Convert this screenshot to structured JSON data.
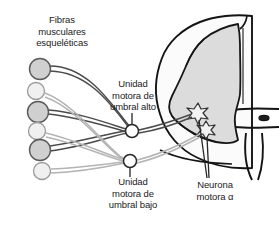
{
  "figure": {
    "background_color": "#ffffff"
  },
  "labels": {
    "muscle_fibers": {
      "name": "muscle-fibers-label",
      "lines": [
        "Fibras",
        "musculares",
        "esqueléticas"
      ]
    },
    "high_threshold_unit": {
      "name": "high-threshold-motor-unit-label",
      "lines": [
        "Unidad",
        "motora de",
        "umbral alto"
      ]
    },
    "low_threshold_unit": {
      "name": "low-threshold-motor-unit-label",
      "lines": [
        "Unidad",
        "motora de",
        "umbral bajo"
      ]
    },
    "alpha_motor_neuron": {
      "name": "alpha-motor-neuron-label",
      "lines": [
        "Neurona",
        "motora α"
      ]
    }
  },
  "muscle_fibers": [
    {
      "id": "fiber-1",
      "type": "fast-large",
      "cx": 40,
      "cy": 69,
      "r": 10.5,
      "fill": "#d0d0d0",
      "stroke": "#5a5a5a"
    },
    {
      "id": "fiber-2",
      "type": "slow-small",
      "cx": 36,
      "cy": 91,
      "r": 8.5,
      "fill": "#f0f0f0",
      "stroke": "#9a9a9a"
    },
    {
      "id": "fiber-3",
      "type": "fast-large",
      "cx": 38,
      "cy": 112,
      "r": 10.5,
      "fill": "#d0d0d0",
      "stroke": "#5a5a5a"
    },
    {
      "id": "fiber-4",
      "type": "slow-small",
      "cx": 37,
      "cy": 131,
      "r": 8.5,
      "fill": "#f0f0f0",
      "stroke": "#9a9a9a"
    },
    {
      "id": "fiber-5",
      "type": "fast-large",
      "cx": 40,
      "cy": 150,
      "r": 10.5,
      "fill": "#d0d0d0",
      "stroke": "#5a5a5a"
    },
    {
      "id": "fiber-6",
      "type": "slow-small",
      "cx": 42,
      "cy": 171,
      "r": 8.5,
      "fill": "#f0f0f0",
      "stroke": "#9a9a9a"
    }
  ],
  "motor_unit_nodes": [
    {
      "id": "high-threshold-node",
      "cx": 132,
      "cy": 131,
      "r": 6.5,
      "stem": "up",
      "fill": "#ffffff",
      "stroke": "#262626"
    },
    {
      "id": "low-threshold-node",
      "cx": 130,
      "cy": 161,
      "r": 6.5,
      "stem": "down",
      "fill": "#ffffff",
      "stroke": "#262626"
    }
  ],
  "spinal_cord": {
    "name": "spinal-cord-cross-section",
    "white_matter_fill": "#fbfbfb",
    "gray_matter_fill": "#dcdcdc",
    "outline_color": "#141414",
    "central_canal": {
      "cx": 264,
      "cy": 118,
      "rx": 5,
      "ry": 2.6
    }
  },
  "alpha_neurons": [
    {
      "id": "alpha-neuron-upper",
      "cx": 198,
      "cy": 112,
      "fill": "#f2f2f2",
      "stroke": "#333333"
    },
    {
      "id": "alpha-neuron-lower",
      "cx": 206,
      "cy": 129,
      "fill": "#f2f2f2",
      "stroke": "#333333"
    }
  ],
  "colors": {
    "axon_dark": "#4a4a4a",
    "axon_light": "#b4b4b4",
    "text": "#1b1b1b",
    "leader_line": "#262626"
  }
}
